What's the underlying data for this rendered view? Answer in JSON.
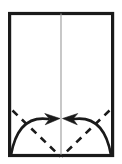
{
  "figure": {
    "title": "Origami fold step",
    "description": "Rectangular sheet of paper with a vertical center crease, two dashed diagonal fold lines rising from the bottom center to the lower side edges, and two curved arrows pointing inward to the center.",
    "background_color": "#ffffff",
    "ink_color": "#1a1a1a",
    "crease_color": "#8c8c8c"
  },
  "paper": {
    "name": "paper-sheet",
    "shape": "rectangle",
    "fill": "#ffffff",
    "stroke": "#1a1a1a",
    "stroke_width": 3.2,
    "x": 9.6,
    "y": 13.5,
    "width": 103,
    "height": 142
  },
  "center_crease": {
    "name": "vertical-center-crease",
    "stroke": "#9a9a9a",
    "stroke_width": 1.1,
    "x": 61,
    "y_top": 13.5,
    "y_bottom": 155.5
  },
  "fold_lines": [
    {
      "name": "fold-line-left",
      "style": "dashed",
      "stroke": "#1a1a1a",
      "stroke_width": 2.6,
      "dash_pattern": "7 6",
      "x1": 12.5,
      "y1": 110.5,
      "x2": 60.5,
      "y2": 156.5
    },
    {
      "name": "fold-line-right",
      "style": "dashed",
      "stroke": "#1a1a1a",
      "stroke_width": 2.6,
      "dash_pattern": "7 6",
      "x1": 109.5,
      "y1": 110.5,
      "x2": 61.5,
      "y2": 156.5
    }
  ],
  "arrows": [
    {
      "name": "fold-arrow-left",
      "direction": "right",
      "stroke": "#1a1a1a",
      "stroke_width": 2.6,
      "start_x": 11,
      "start_y": 155,
      "control_x": 18,
      "control_y": 115,
      "end_x": 48,
      "end_y": 119,
      "tip_x": 60,
      "tip_y": 118.5
    },
    {
      "name": "fold-arrow-right",
      "direction": "left",
      "stroke": "#1a1a1a",
      "stroke_width": 2.6,
      "start_x": 111,
      "start_y": 155,
      "control_x": 104,
      "control_y": 115,
      "end_x": 74,
      "end_y": 119,
      "tip_x": 62.5,
      "tip_y": 118.5
    }
  ]
}
